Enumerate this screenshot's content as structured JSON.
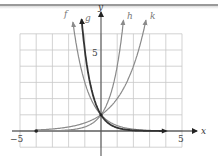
{
  "chart_data": {
    "type": "line",
    "title": "",
    "xlabel": "x",
    "ylabel": "y",
    "xlim": [
      -5,
      5
    ],
    "ylim": [
      -1,
      6
    ],
    "grid": true,
    "tick_labels": {
      "x": [
        "−5",
        "5"
      ],
      "y": [
        "5"
      ]
    },
    "series": [
      {
        "name": "f",
        "formula": "(1/3)^x",
        "base": 0.3333,
        "color": "#8a8a8a",
        "width": 1.2,
        "x_range": [
          -4,
          4
        ],
        "label_x": -1.9
      },
      {
        "name": "g",
        "formula": "(1/5)^x",
        "base": 0.2,
        "color": "#333333",
        "width": 1.8,
        "x_range": [
          -4,
          4
        ],
        "label_x": -1.2
      },
      {
        "name": "h",
        "formula": "4^x",
        "base": 4,
        "color": "#8a8a8a",
        "width": 1.2,
        "x_range": [
          -4,
          4
        ],
        "label_x": 1.4
      },
      {
        "name": "k",
        "formula": "2^x",
        "base": 2,
        "color": "#8a8a8a",
        "width": 1.2,
        "x_range": [
          -4,
          4
        ],
        "label_x": 2.8
      }
    ],
    "common_point": [
      0,
      1
    ],
    "legend": "inline labels at curve tops"
  },
  "labels": {
    "x_axis": "x",
    "y_axis": "y",
    "x_min_tick": "−5",
    "x_max_tick": "5",
    "y_tick": "5",
    "f": "f",
    "g": "g",
    "h": "h",
    "k": "k"
  }
}
